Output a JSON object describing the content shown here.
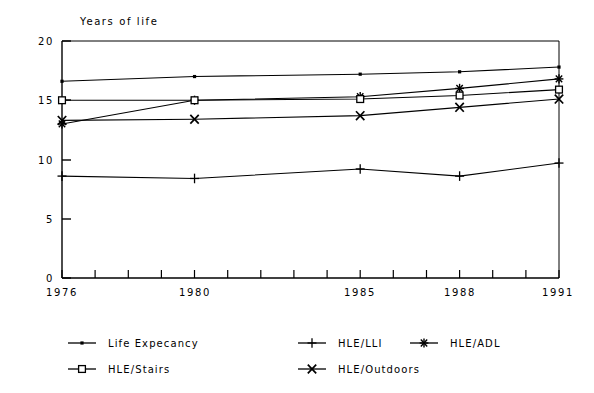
{
  "chart_data": {
    "type": "line",
    "title": "",
    "ylabel": "Years of life",
    "xlabel": "",
    "ylim": [
      0,
      20
    ],
    "yticks": [
      0,
      5,
      10,
      15,
      20
    ],
    "xlim": [
      1976,
      1991
    ],
    "xticks": [
      1976,
      1980,
      1985,
      1988,
      1991
    ],
    "xtick_labels": [
      "1976",
      "1980",
      "1985",
      "1988",
      "1991"
    ],
    "ytick_labels": [
      "0",
      "5",
      "10",
      "15",
      "20"
    ],
    "x": [
      1976,
      1980,
      1985,
      1988,
      1991
    ],
    "grid": false,
    "legend_position": "bottom",
    "series": [
      {
        "name": "Life Expecancy",
        "marker": "small-square-dot",
        "values": [
          16.6,
          17.0,
          17.2,
          17.4,
          17.8
        ]
      },
      {
        "name": "HLE/LLI",
        "marker": "plus",
        "values": [
          8.6,
          8.4,
          9.2,
          8.6,
          9.7
        ]
      },
      {
        "name": "HLE/ADL",
        "marker": "asterisk",
        "values": [
          13.0,
          15.0,
          15.3,
          16.0,
          16.8
        ]
      },
      {
        "name": "HLE/Stairs",
        "marker": "open-square",
        "values": [
          15.0,
          15.0,
          15.1,
          15.4,
          15.9
        ]
      },
      {
        "name": "HLE/Outdoors",
        "marker": "x-cross",
        "values": [
          13.3,
          13.4,
          13.7,
          14.4,
          15.1
        ]
      }
    ]
  },
  "axes": {
    "y_axis_title": "Years of life",
    "y_tick_labels": [
      "20",
      "15",
      "10",
      "5",
      "0"
    ],
    "x_tick_labels": [
      "1976",
      "1980",
      "1985",
      "1988",
      "1991"
    ]
  },
  "legend": {
    "entries": [
      {
        "label": "Life Expecancy",
        "marker": "small-square-dot"
      },
      {
        "label": "HLE/LLI",
        "marker": "plus"
      },
      {
        "label": "HLE/ADL",
        "marker": "asterisk"
      },
      {
        "label": "HLE/Stairs",
        "marker": "open-square"
      },
      {
        "label": "HLE/Outdoors",
        "marker": "x-cross"
      }
    ]
  },
  "colors": {
    "ink": "#000000",
    "background": "#ffffff"
  }
}
